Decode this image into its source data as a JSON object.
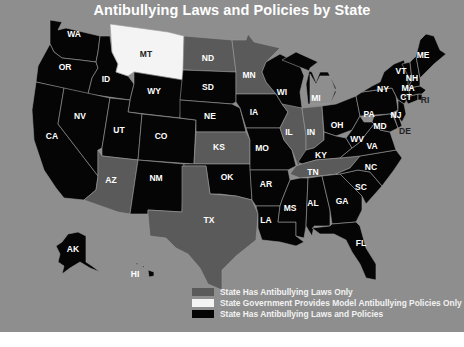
{
  "title": "Antibullying Laws and Policies by State",
  "colors": {
    "background": "#8e8e8e",
    "laws_only": "#5a5a5a",
    "model_policies_only": "#f4f4f4",
    "laws_and_policies": "#050505",
    "page_bottom": "#ffffff"
  },
  "legend": [
    {
      "key": "laws_only",
      "label": "State Has Antibullying Laws Only",
      "color": "#5a5a5a"
    },
    {
      "key": "model_policies_only",
      "label": "State Government Provides Model Antibullying Policies Only",
      "color": "#f4f4f4"
    },
    {
      "key": "laws_and_policies",
      "label": "State Has Antibullying Laws and Policies",
      "color": "#050505"
    }
  ],
  "states": {
    "WA": {
      "label": "WA",
      "category": "laws_and_policies"
    },
    "OR": {
      "label": "OR",
      "category": "laws_and_policies"
    },
    "CA": {
      "label": "CA",
      "category": "laws_and_policies"
    },
    "ID": {
      "label": "ID",
      "category": "laws_and_policies"
    },
    "NV": {
      "label": "NV",
      "category": "laws_and_policies"
    },
    "MT": {
      "label": "MT",
      "category": "model_policies_only"
    },
    "WY": {
      "label": "WY",
      "category": "laws_and_policies"
    },
    "UT": {
      "label": "UT",
      "category": "laws_and_policies"
    },
    "AZ": {
      "label": "AZ",
      "category": "laws_only"
    },
    "CO": {
      "label": "CO",
      "category": "laws_and_policies"
    },
    "NM": {
      "label": "NM",
      "category": "laws_and_policies"
    },
    "ND": {
      "label": "ND",
      "category": "laws_only"
    },
    "SD": {
      "label": "SD",
      "category": "laws_and_policies"
    },
    "NE": {
      "label": "NE",
      "category": "laws_and_policies"
    },
    "KS": {
      "label": "KS",
      "category": "laws_only"
    },
    "OK": {
      "label": "OK",
      "category": "laws_and_policies"
    },
    "TX": {
      "label": "TX",
      "category": "laws_only"
    },
    "MN": {
      "label": "MN",
      "category": "laws_only"
    },
    "IA": {
      "label": "IA",
      "category": "laws_and_policies"
    },
    "MO": {
      "label": "MO",
      "category": "laws_and_policies"
    },
    "AR": {
      "label": "AR",
      "category": "laws_and_policies"
    },
    "LA": {
      "label": "LA",
      "category": "laws_and_policies"
    },
    "WI": {
      "label": "WI",
      "category": "laws_and_policies"
    },
    "IL": {
      "label": "IL",
      "category": "laws_only"
    },
    "MI": {
      "label": "MI",
      "category": "laws_and_policies"
    },
    "IN": {
      "label": "IN",
      "category": "laws_only"
    },
    "OH": {
      "label": "OH",
      "category": "laws_and_policies"
    },
    "KY": {
      "label": "KY",
      "category": "laws_and_policies"
    },
    "TN": {
      "label": "TN",
      "category": "laws_only"
    },
    "MS": {
      "label": "MS",
      "category": "laws_and_policies"
    },
    "AL": {
      "label": "AL",
      "category": "laws_and_policies"
    },
    "GA": {
      "label": "GA",
      "category": "laws_and_policies"
    },
    "FL": {
      "label": "FL",
      "category": "laws_and_policies"
    },
    "SC": {
      "label": "SC",
      "category": "laws_and_policies"
    },
    "NC": {
      "label": "NC",
      "category": "laws_and_policies"
    },
    "VA": {
      "label": "VA",
      "category": "laws_and_policies"
    },
    "WV": {
      "label": "WV",
      "category": "laws_and_policies"
    },
    "PA": {
      "label": "PA",
      "category": "laws_and_policies"
    },
    "NY": {
      "label": "NY",
      "category": "laws_and_policies"
    },
    "MD": {
      "label": "MD",
      "category": "laws_and_policies"
    },
    "DE": {
      "label": "DE",
      "category": "laws_and_policies"
    },
    "NJ": {
      "label": "NJ",
      "category": "laws_and_policies"
    },
    "CT": {
      "label": "CT",
      "category": "laws_and_policies"
    },
    "RI": {
      "label": "RI",
      "category": "laws_and_policies"
    },
    "MA": {
      "label": "MA",
      "category": "laws_and_policies"
    },
    "VT": {
      "label": "VT",
      "category": "laws_and_policies"
    },
    "NH": {
      "label": "NH",
      "category": "laws_and_policies"
    },
    "ME": {
      "label": "ME",
      "category": "laws_and_policies"
    },
    "AK": {
      "label": "AK",
      "category": "laws_and_policies"
    },
    "HI": {
      "label": "HI",
      "category": "laws_and_policies"
    }
  }
}
